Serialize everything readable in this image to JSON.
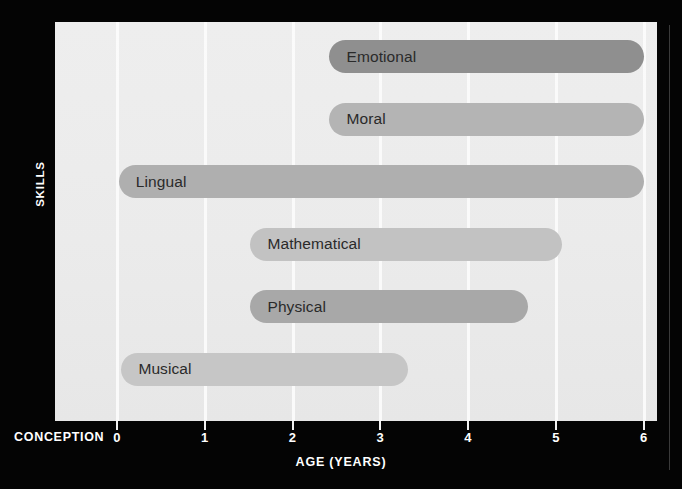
{
  "chart_data": {
    "type": "bar",
    "orientation": "horizontal",
    "title": "",
    "xlabel": "AGE (YEARS)",
    "ylabel": "SKILLS",
    "xlim": [
      0,
      6
    ],
    "xticks": [
      0,
      1,
      2,
      3,
      4,
      5,
      6
    ],
    "xticklabels": [
      "0",
      "1",
      "2",
      "3",
      "4",
      "5",
      "6"
    ],
    "origin_label": "CONCEPTION",
    "grid": true,
    "grid_axis": "x",
    "grid_color": "#fbfbfb",
    "panel_color": "#ebebeb",
    "background_color": "#000000",
    "axis_text_color": "#ffffff",
    "bar_label_color": "#2a2a2a",
    "categories": [
      "Emotional",
      "Moral",
      "Lingual",
      "Mathematical",
      "Physical",
      "Musical"
    ],
    "bars": [
      {
        "label": "Emotional",
        "start": 2.42,
        "end": 6.0,
        "span": 3.58,
        "color": "#8f8f8f"
      },
      {
        "label": "Moral",
        "start": 2.42,
        "end": 6.0,
        "span": 3.58,
        "color": "#b4b4b4"
      },
      {
        "label": "Lingual",
        "start": 0.02,
        "end": 6.0,
        "span": 5.98,
        "color": "#afafaf"
      },
      {
        "label": "Mathematical",
        "start": 1.52,
        "end": 5.07,
        "span": 3.55,
        "color": "#c2c2c2"
      },
      {
        "label": "Physical",
        "start": 1.52,
        "end": 4.68,
        "span": 3.16,
        "color": "#a8a8a8"
      },
      {
        "label": "Musical",
        "start": 0.05,
        "end": 3.31,
        "span": 3.26,
        "color": "#c6c6c6"
      }
    ]
  }
}
